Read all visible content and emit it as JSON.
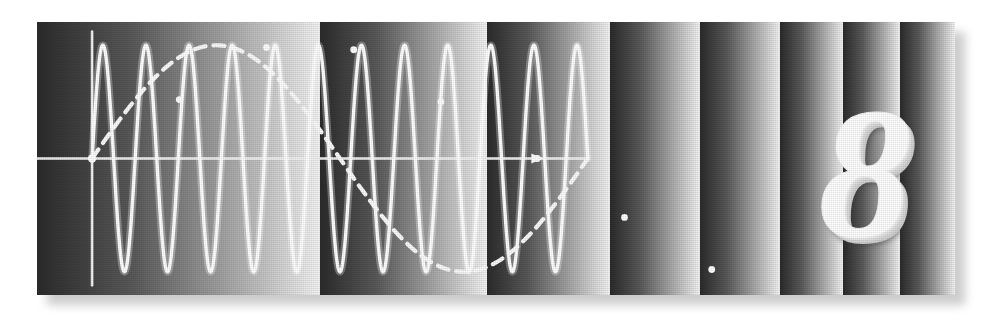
{
  "figure": {
    "plate_label": "8",
    "caption": "",
    "background_color": "#ffffff",
    "plate_rect": {
      "x": 37,
      "y": 22,
      "width": 918,
      "height": 273
    },
    "shadow_color": "#b9b9b9",
    "trace_color": "#ffffff",
    "axis_color": "#f2f2f2",
    "envelope_color": "#fafafa",
    "band_dark": "#2b2b2b",
    "band_light": "#f4f4f4"
  },
  "bands": {
    "description": "repeating dark-to-light vertical gradient strips, progressively narrower to the right",
    "widths": [
      283,
      167,
      123,
      90,
      80,
      63,
      57,
      55
    ],
    "count": 8
  },
  "chart_data": {
    "type": "line",
    "title": "",
    "subtitle": "",
    "xlabel": "",
    "ylabel": "",
    "xlim": [
      0,
      1
    ],
    "ylim": [
      -1.15,
      1.15
    ],
    "grid": false,
    "legend": "none",
    "annotations": [
      {
        "text": "8",
        "role": "plate-number",
        "x": 0.9,
        "y": 0.0
      }
    ],
    "axes": {
      "vertical_axis_x": 0.06,
      "horizontal_axis_y": 0.0,
      "horizontal_axis_extends_to": 0.6,
      "arrow_marker_x": 0.545,
      "origin_marker": true
    },
    "series": [
      {
        "name": "carrier",
        "role": "oscilloscope-trace",
        "style": "solid",
        "color": "#ffffff",
        "cycles": 11.5,
        "amplitude": 1.0,
        "note": "constant-amplitude high-frequency sinusoid, 11 full peaks visible"
      },
      {
        "name": "envelope",
        "role": "modulation-envelope",
        "style": "dashed",
        "color": "#fafafa",
        "cycles": 1.0,
        "amplitude": 1.0,
        "note": "single-period sinusoid: positive lobe over left half, negative lobe over right half"
      }
    ],
    "markers": [
      {
        "label": "",
        "x": 0.06,
        "y": 0.0
      },
      {
        "label": "",
        "x": 0.155,
        "y": 0.52
      },
      {
        "label": "",
        "x": 0.25,
        "y": 0.98
      },
      {
        "label": "",
        "x": 0.345,
        "y": 0.96
      },
      {
        "label": "",
        "x": 0.44,
        "y": 0.5
      },
      {
        "label": "",
        "x": 0.545,
        "y": 0.0
      },
      {
        "label": "",
        "x": 0.64,
        "y": -0.52
      },
      {
        "label": "",
        "x": 0.735,
        "y": -0.98
      }
    ]
  }
}
